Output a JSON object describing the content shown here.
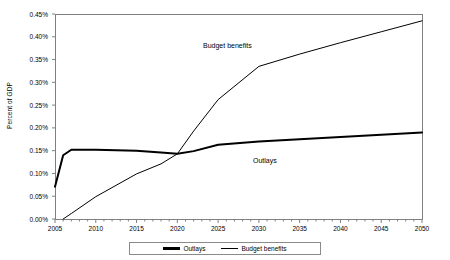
{
  "chart_data": {
    "type": "line",
    "title": "",
    "xlabel": "",
    "ylabel": "Percent of GDP",
    "xlim": [
      2005,
      2050
    ],
    "ylim": [
      0.0,
      0.45
    ],
    "grid": false,
    "legend_position": "bottom",
    "x_ticks": [
      2005,
      2010,
      2015,
      2020,
      2025,
      2030,
      2035,
      2040,
      2045,
      2050
    ],
    "x_tick_labels": [
      "2005",
      "2010",
      "2015",
      "2020",
      "2025",
      "2030",
      "2035",
      "2040",
      "2045",
      "2050"
    ],
    "x_minor_tick_interval": 1,
    "y_ticks": [
      0.0,
      0.05,
      0.1,
      0.15,
      0.2,
      0.25,
      0.3,
      0.35,
      0.4,
      0.45
    ],
    "y_tick_labels": [
      "0.00%",
      "0.05%",
      "0.10%",
      "0.15%",
      "0.20%",
      "0.25%",
      "0.30%",
      "0.35%",
      "0.40%",
      "0.45%"
    ],
    "series": [
      {
        "name": "Outlays",
        "color": "#000000",
        "line_width": 2.0,
        "x": [
          2005,
          2006,
          2007,
          2010,
          2015,
          2018,
          2020,
          2022,
          2025,
          2030,
          2035,
          2040,
          2045,
          2050
        ],
        "values": [
          0.071,
          0.14,
          0.152,
          0.152,
          0.15,
          0.146,
          0.143,
          0.149,
          0.163,
          0.17,
          0.175,
          0.18,
          0.185,
          0.19
        ]
      },
      {
        "name": "Budget benefits",
        "color": "#000000",
        "line_width": 1.0,
        "x": [
          2006,
          2007,
          2010,
          2015,
          2018,
          2020,
          2022,
          2025,
          2030,
          2035,
          2040,
          2045,
          2050
        ],
        "values": [
          0.0,
          0.012,
          0.049,
          0.099,
          0.121,
          0.143,
          0.193,
          0.262,
          0.335,
          0.362,
          0.387,
          0.411,
          0.435
        ]
      }
    ],
    "annotations": [
      {
        "text": "Budget benefits",
        "x": 2023,
        "y": 0.405
      },
      {
        "text": "Outlays",
        "x": 2029,
        "y": 0.128
      }
    ],
    "legend_entries": [
      {
        "label": "Outlays",
        "style": "thick"
      },
      {
        "label": "Budget benefits",
        "style": "thin"
      }
    ],
    "axis_color": "#808080",
    "plot_border_color": "#808080"
  }
}
